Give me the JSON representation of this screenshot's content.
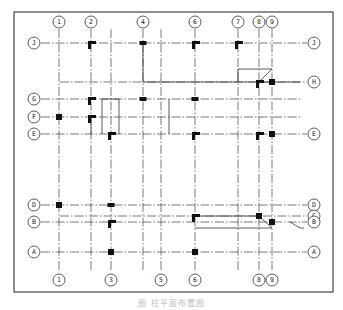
{
  "figure": {
    "caption": "图 柱平面布置图",
    "frame": {
      "x": 14,
      "y": 12,
      "width": 319,
      "height": 280
    }
  },
  "axes": {
    "vertical": [
      {
        "label": "1",
        "x": 59,
        "top_bubble": true,
        "bottom_bubble": true
      },
      {
        "label": "2",
        "x": 91,
        "top_bubble": true,
        "bottom_bubble": false
      },
      {
        "label": "3",
        "x": 111,
        "top_bubble": false,
        "bottom_bubble": true
      },
      {
        "label": "4",
        "x": 143,
        "top_bubble": true,
        "bottom_bubble": false
      },
      {
        "label": "5",
        "x": 161,
        "top_bubble": false,
        "bottom_bubble": true
      },
      {
        "label": "6",
        "x": 195,
        "top_bubble": true,
        "bottom_bubble": true
      },
      {
        "label": "7",
        "x": 238,
        "top_bubble": true,
        "bottom_bubble": false
      },
      {
        "label": "8",
        "x": 259,
        "top_bubble": true,
        "bottom_bubble": true
      },
      {
        "label": "9",
        "x": 272,
        "top_bubble": true,
        "bottom_bubble": true
      }
    ],
    "horizontal": [
      {
        "label": "J",
        "y": 43,
        "left_bubble": true,
        "right_bubble": true
      },
      {
        "label": "H",
        "y": 82,
        "left_bubble": false,
        "right_bubble": true
      },
      {
        "label": "G",
        "y": 99,
        "left_bubble": true,
        "right_bubble": false
      },
      {
        "label": "F",
        "y": 117,
        "left_bubble": true,
        "right_bubble": false
      },
      {
        "label": "E",
        "y": 134,
        "left_bubble": true,
        "right_bubble": true
      },
      {
        "label": "D",
        "y": 205,
        "left_bubble": true,
        "right_bubble": true
      },
      {
        "label": "C",
        "y": 216,
        "left_bubble": false,
        "right_bubble": true
      },
      {
        "label": "B",
        "y": 222,
        "left_bubble": true,
        "right_bubble": true
      },
      {
        "label": "A",
        "y": 252,
        "left_bubble": true,
        "right_bubble": true
      }
    ]
  },
  "columns": [
    {
      "at": "2-J",
      "shape": "L"
    },
    {
      "at": "4-J",
      "shape": "rect"
    },
    {
      "at": "6-J",
      "shape": "L"
    },
    {
      "at": "7-J",
      "shape": "L"
    },
    {
      "at": "9-H",
      "shape": "square"
    },
    {
      "at": "8-H",
      "shape": "L"
    },
    {
      "at": "2-G",
      "shape": "L"
    },
    {
      "at": "4-G",
      "shape": "rect"
    },
    {
      "at": "6-G",
      "shape": "rect"
    },
    {
      "at": "1-F",
      "shape": "square"
    },
    {
      "at": "2-F",
      "shape": "L"
    },
    {
      "at": "3-E",
      "shape": "L"
    },
    {
      "at": "6-E",
      "shape": "L"
    },
    {
      "at": "8-E",
      "shape": "L"
    },
    {
      "at": "9-E",
      "shape": "square"
    },
    {
      "at": "1-D",
      "shape": "square"
    },
    {
      "at": "3-D",
      "shape": "rect"
    },
    {
      "at": "6-C",
      "shape": "L"
    },
    {
      "at": "8-C",
      "shape": "square"
    },
    {
      "at": "9-B",
      "shape": "square"
    },
    {
      "at": "3-B",
      "shape": "L"
    },
    {
      "at": "3-A",
      "shape": "square"
    },
    {
      "at": "6-A",
      "shape": "square"
    }
  ]
}
